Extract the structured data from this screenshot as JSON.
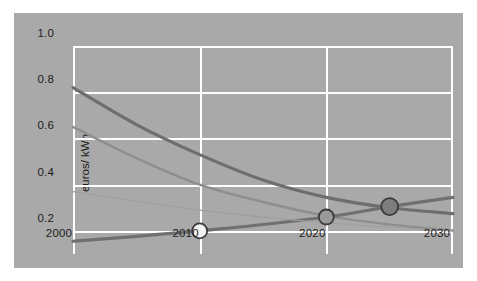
{
  "figure": {
    "panel_color": "#a9a9a9",
    "grid_color": "#ffffff",
    "page_color": "#ffffff"
  },
  "axes": {
    "ylabel": "euros/ kWh",
    "yticks": [
      "1.0",
      "0.8",
      "0.6",
      "0.4",
      "0.2"
    ],
    "xticks": [
      "2000",
      "2010",
      "2020",
      "2030"
    ]
  },
  "chart_data": {
    "type": "line",
    "title": "",
    "xlabel": "",
    "ylabel": "euros/ kWh",
    "xlim": [
      2000,
      2030
    ],
    "ylim": [
      0.1,
      1.0
    ],
    "xticks": [
      2000,
      2010,
      2020,
      2030
    ],
    "yticks": [
      0.2,
      0.4,
      0.6,
      0.8,
      1.0
    ],
    "grid": true,
    "legend": "none",
    "series": [
      {
        "name": "declining-cost-curve-dark",
        "color": "#6e6e6e",
        "width": 3.2,
        "x": [
          2000,
          2005,
          2010,
          2015,
          2020,
          2025,
          2030
        ],
        "values": [
          0.82,
          0.66,
          0.53,
          0.42,
          0.345,
          0.3,
          0.275
        ]
      },
      {
        "name": "declining-cost-curve-light",
        "color": "#8e8e8e",
        "width": 2.4,
        "x": [
          2000,
          2005,
          2010,
          2015,
          2020,
          2025,
          2030
        ],
        "values": [
          0.65,
          0.515,
          0.4,
          0.325,
          0.265,
          0.228,
          0.202
        ]
      },
      {
        "name": "rising-grid-price-line",
        "color": "#707070",
        "width": 3.2,
        "x": [
          2000,
          2010,
          2020,
          2025,
          2030
        ],
        "values": [
          0.155,
          0.2,
          0.26,
          0.305,
          0.345
        ]
      },
      {
        "name": "faint-declining-line",
        "color": "#9e9e9e",
        "width": 1.1,
        "x": [
          2000,
          2010,
          2020,
          2030
        ],
        "values": [
          0.37,
          0.29,
          0.235,
          0.2
        ]
      }
    ],
    "markers": [
      {
        "name": "marker-2010",
        "x": 2010,
        "y": 0.2,
        "fill": "#f2f2f2",
        "edge": "#3a3a3a",
        "radius": 7.5
      },
      {
        "name": "marker-2020",
        "x": 2020,
        "y": 0.26,
        "fill": "#9a9a9a",
        "edge": "#3a3a3a",
        "radius": 7.5
      },
      {
        "name": "marker-2025",
        "x": 2025,
        "y": 0.305,
        "fill": "#7d7d7d",
        "edge": "#3a3a3a",
        "radius": 8.5
      }
    ]
  }
}
